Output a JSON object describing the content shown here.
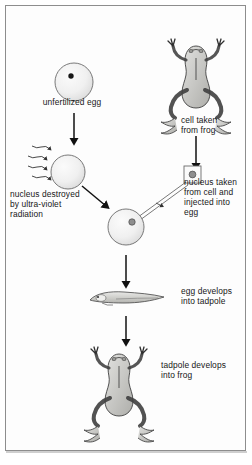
{
  "figure": {
    "border_color": "#8d8d8d",
    "background_color": "#fdfdfd",
    "ink_color": "#171717"
  },
  "captions": {
    "unfertilized_egg": "unfertilized egg",
    "cell_taken_from_frog": "cell taken\nfrom frog",
    "nucleus_destroyed": "nucleus destroyed\nby ultra-violet\nradiation",
    "nucleus_taken_injected": "nucleus taken\nfrom cell and\ninjected into\negg",
    "egg_develops_into_tadpole": "egg develops\ninto tadpole",
    "tadpole_develops_into_frog": "tadpole develops\ninto frog"
  },
  "illustrations": {
    "donor_frog": "frog-illustration",
    "unfertilized_egg": "egg-with-nucleus-illustration",
    "irradiated_egg": "egg-irradiated-illustration",
    "uv_rays": "uv-ray-arrows",
    "donor_cell": "cell-square-with-nucleus",
    "pipette": "micropipette-needle",
    "enucleated_egg": "egg-injected-with-nucleus",
    "tadpole": "tadpole-illustration",
    "cloned_frog": "frog-illustration"
  },
  "flow_arrows": [
    {
      "name": "arrow-egg-to-irradiation",
      "from": "unfertilized egg",
      "to": "irradiated egg"
    },
    {
      "name": "arrow-frog-to-cell",
      "from": "donor frog",
      "to": "donor cell"
    },
    {
      "name": "arrow-irradiated-egg-to-recipient-egg",
      "from": "irradiated egg",
      "to": "recipient egg"
    },
    {
      "name": "arrow-cell-to-egg-injection",
      "from": "donor cell nucleus",
      "to": "recipient egg"
    },
    {
      "name": "arrow-egg-to-tadpole",
      "from": "recipient egg",
      "to": "tadpole"
    },
    {
      "name": "arrow-tadpole-to-frog",
      "from": "tadpole",
      "to": "cloned frog"
    }
  ]
}
